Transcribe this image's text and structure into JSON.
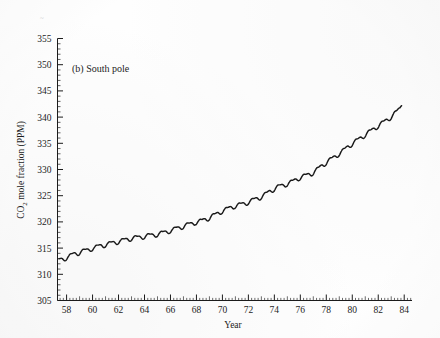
{
  "figure": {
    "panel_label": "(b) South pole",
    "background_color": "#fefefe",
    "line_color": "#1a1a1a"
  },
  "chart_data": {
    "type": "line",
    "title": "(b) South pole",
    "xlabel": "Year",
    "ylabel": "CO2 mole fraction (PPM)",
    "ylabel_main": "CO",
    "ylabel_sub": "2",
    "ylabel_rest": " mole fraction (PPM)",
    "xlim": [
      1957.3,
      1984.6
    ],
    "ylim": [
      305,
      355
    ],
    "xticks": [
      58,
      60,
      62,
      64,
      66,
      68,
      70,
      72,
      74,
      76,
      78,
      80,
      82,
      84
    ],
    "xtick_labels": [
      "58",
      "60",
      "62",
      "64",
      "66",
      "68",
      "70",
      "72",
      "74",
      "76",
      "78",
      "80",
      "82",
      "84"
    ],
    "xtick_years": [
      1958,
      1960,
      1962,
      1964,
      1966,
      1968,
      1970,
      1972,
      1974,
      1976,
      1978,
      1980,
      1982,
      1984
    ],
    "x_minor_interval": 0.25,
    "yticks": [
      305,
      310,
      315,
      320,
      325,
      330,
      335,
      340,
      345,
      350,
      355
    ],
    "ytick_labels": [
      "305",
      "310",
      "315",
      "320",
      "325",
      "330",
      "335",
      "340",
      "345",
      "350",
      "355"
    ],
    "y_minor_interval": 1,
    "grid": false,
    "legend": "none",
    "seasonal_amplitude_ppm": 0.55,
    "series": [
      {
        "name": "CO2 mole fraction, South Pole",
        "x": [
          1957.42,
          1957.67,
          1957.92,
          1958.17,
          1958.42,
          1958.67,
          1958.92,
          1959.17,
          1959.42,
          1959.67,
          1959.92,
          1960.17,
          1960.42,
          1960.67,
          1960.92,
          1961.17,
          1961.42,
          1961.67,
          1961.92,
          1962.17,
          1962.42,
          1962.67,
          1962.92,
          1963.17,
          1963.42,
          1963.67,
          1963.92,
          1964.17,
          1964.42,
          1964.67,
          1964.92,
          1965.17,
          1965.42,
          1965.67,
          1965.92,
          1966.17,
          1966.42,
          1966.67,
          1966.92,
          1967.17,
          1967.42,
          1967.67,
          1967.92,
          1968.17,
          1968.42,
          1968.67,
          1968.92,
          1969.17,
          1969.42,
          1969.67,
          1969.92,
          1970.17,
          1970.42,
          1970.67,
          1970.92,
          1971.17,
          1971.42,
          1971.67,
          1971.92,
          1972.17,
          1972.42,
          1972.67,
          1972.92,
          1973.17,
          1973.42,
          1973.67,
          1973.92,
          1974.17,
          1974.42,
          1974.67,
          1974.92,
          1975.17,
          1975.42,
          1975.67,
          1975.92,
          1976.17,
          1976.42,
          1976.67,
          1976.92,
          1977.17,
          1977.42,
          1977.67,
          1977.92,
          1978.17,
          1978.42,
          1978.67,
          1978.92,
          1979.17,
          1979.42,
          1979.67,
          1979.92,
          1980.17,
          1980.42,
          1980.67,
          1980.92,
          1981.17,
          1981.42,
          1981.67,
          1981.92,
          1982.17,
          1982.42,
          1982.67,
          1982.92,
          1983.17,
          1983.42,
          1983.67,
          1983.83
        ],
        "y": [
          312.6,
          313.0,
          313.3,
          313.2,
          313.6,
          314.1,
          314.3,
          314.2,
          314.4,
          314.8,
          315.1,
          314.9,
          315.2,
          315.6,
          315.8,
          315.6,
          315.8,
          316.2,
          316.4,
          316.2,
          316.4,
          316.8,
          317.0,
          316.8,
          316.9,
          317.2,
          317.4,
          317.2,
          317.3,
          317.6,
          317.8,
          317.6,
          317.8,
          318.2,
          318.5,
          318.3,
          318.6,
          319.0,
          319.3,
          319.2,
          319.4,
          319.8,
          320.1,
          319.9,
          320.1,
          320.6,
          320.9,
          320.9,
          321.2,
          321.8,
          322.2,
          322.1,
          322.4,
          322.9,
          323.2,
          323.0,
          323.2,
          323.6,
          323.9,
          323.8,
          324.1,
          324.6,
          324.9,
          324.9,
          325.3,
          326.0,
          326.4,
          326.4,
          326.7,
          327.1,
          327.4,
          327.3,
          327.6,
          328.2,
          328.6,
          328.5,
          328.7,
          329.2,
          329.5,
          329.6,
          330.1,
          330.9,
          331.4,
          331.5,
          331.9,
          332.6,
          333.1,
          333.2,
          333.7,
          334.5,
          335.0,
          335.1,
          335.5,
          336.2,
          336.7,
          336.8,
          337.2,
          337.9,
          338.4,
          338.5,
          338.9,
          339.6,
          340.1,
          340.3,
          340.9,
          341.8,
          342.9
        ]
      }
    ]
  }
}
